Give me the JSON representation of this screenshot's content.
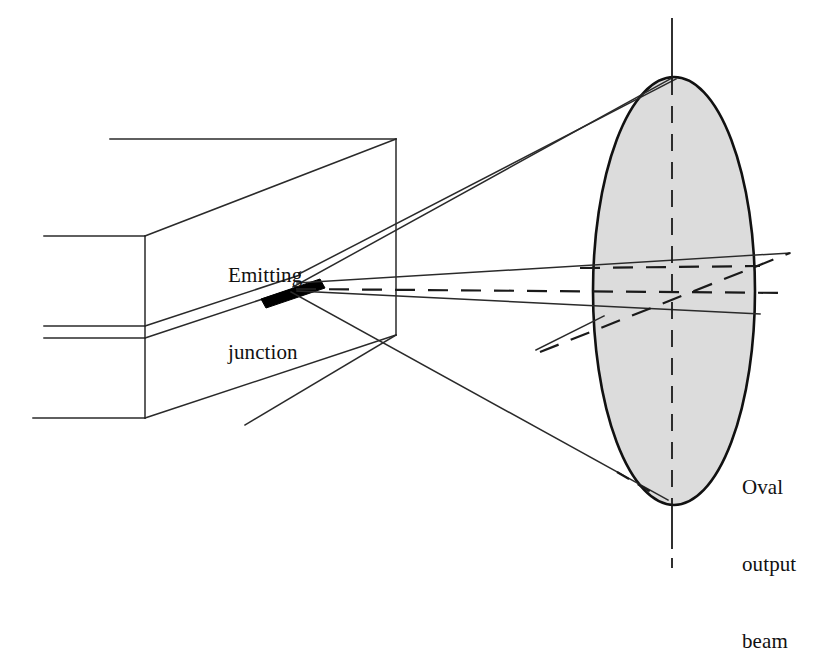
{
  "figure": {
    "type": "technical-line-diagram",
    "background_color": "#ffffff",
    "line_color": "#1a1a1a",
    "junction_fill_color": "#000000",
    "beam_fill_color": "#dcdcdc",
    "beam_outline_color": "#111111"
  },
  "labels": {
    "emitting_junction": {
      "line1": "Emitting",
      "line2": "junction",
      "full_text": "Emitting junction"
    },
    "oval_output_beam": {
      "line1": "Oval",
      "line2": "output",
      "line3": "beam",
      "full_text": "Oval output beam"
    }
  },
  "geometry": {
    "diode_body": {
      "front_face_left_x": 145,
      "front_face_right_x": 395,
      "front_face_top_y": 139,
      "front_face_bottom_y": 335,
      "left_edge_top_y": 236,
      "left_edge_bottom_y": 418,
      "cut_line_top_y": 326,
      "cut_line_bottom_y": 338
    },
    "junction": {
      "center_x": 293,
      "center_y": 289,
      "half_length": 33,
      "thickness": 11
    },
    "oval_beam": {
      "center_x": 674,
      "center_y": 291,
      "radius_x": 81,
      "radius_y": 214
    },
    "axes": {
      "vertical_center_x": 672,
      "vertical_top_y": 18,
      "vertical_bottom_y": 568,
      "horizontal_y": 291
    }
  }
}
